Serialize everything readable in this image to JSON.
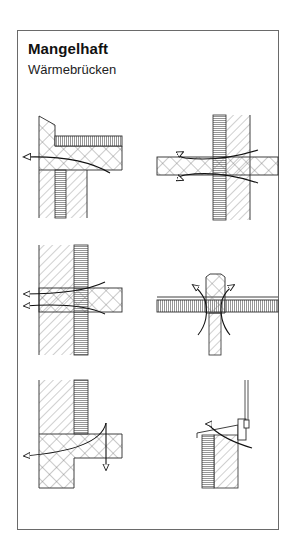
{
  "header": {
    "title": "Mangelhaft",
    "subtitle": "Wärmebrücken"
  },
  "diagrams": [
    {
      "id": "d1",
      "description": "Balcony slab / parapet junction — heat flow escaping through slab edge"
    },
    {
      "id": "d2",
      "description": "Slab penetrating insulated wall — heat flow along slab both sides"
    },
    {
      "id": "d3",
      "description": "Floor slab through wall with external insulation — heat flow to exterior"
    },
    {
      "id": "d4",
      "description": "Wall head penetrating roof insulation — heat flow upward around cap"
    },
    {
      "id": "d5",
      "description": "Base slab / wall junction — heat flow outward and downward"
    },
    {
      "id": "d6",
      "description": "Window sill on insulated wall — heat flow around sill"
    }
  ],
  "legend_patterns": {
    "masonry": "diagonal hatch",
    "concrete": "cross hatch",
    "insulation": "fine stripes"
  },
  "colors": {
    "line": "#2a2a2a",
    "hatch": "#7a7a7a",
    "insulation": "#8a8a8a",
    "frame": "#6a6a6a"
  }
}
